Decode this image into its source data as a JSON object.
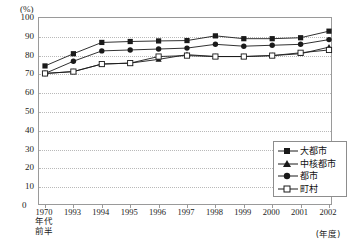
{
  "axis": {
    "y_unit": "(%)",
    "y_ticks": [
      100,
      90,
      80,
      70,
      60,
      50,
      40,
      30,
      20,
      10,
      0
    ],
    "x_unit": "(年度)",
    "zero": "0"
  },
  "legend": {
    "position": "bottom-right",
    "items": [
      {
        "label": "大都市",
        "marker": "filled-square",
        "color": "#1a1a1a"
      },
      {
        "label": "中核都市",
        "marker": "filled-triangle",
        "color": "#1a1a1a"
      },
      {
        "label": "都市",
        "marker": "filled-circle",
        "color": "#1a1a1a"
      },
      {
        "label": "町村",
        "marker": "open-square",
        "color": "#1a1a1a"
      }
    ]
  },
  "chart_data": {
    "type": "line",
    "title": "",
    "subtitle": "",
    "xlabel": "(年度)",
    "ylabel": "(%)",
    "ylim": [
      0,
      100
    ],
    "ytick_step": 10,
    "grid": true,
    "legend_position": "lower right",
    "categories": [
      "1970年代前半",
      "1993",
      "1994",
      "1995",
      "1996",
      "1997",
      "1998",
      "1999",
      "2000",
      "2001",
      "2002"
    ],
    "category_lines": [
      [
        "1970",
        "年代",
        "前半"
      ],
      [
        "1993"
      ],
      [
        "1994"
      ],
      [
        "1995"
      ],
      [
        "1996"
      ],
      [
        "1997"
      ],
      [
        "1998"
      ],
      [
        "1999"
      ],
      [
        "2000"
      ],
      [
        "2001"
      ],
      [
        "2002"
      ]
    ],
    "series": [
      {
        "name": "大都市",
        "marker": "filled-square",
        "values": [
          74.5,
          81.0,
          87.0,
          87.5,
          87.8,
          88.0,
          90.5,
          89.0,
          89.0,
          89.5,
          93.0
        ]
      },
      {
        "name": "中核都市",
        "marker": "filled-triangle",
        "values": [
          70.5,
          71.5,
          75.5,
          76.0,
          78.0,
          80.5,
          79.5,
          79.5,
          80.0,
          81.0,
          84.5
        ]
      },
      {
        "name": "都市",
        "marker": "filled-circle",
        "values": [
          70.5,
          77.0,
          82.5,
          83.0,
          83.5,
          84.0,
          86.0,
          85.0,
          85.5,
          86.0,
          88.5
        ]
      },
      {
        "name": "町村",
        "marker": "open-square",
        "values": [
          70.5,
          71.5,
          75.5,
          76.0,
          79.5,
          80.0,
          79.5,
          79.5,
          80.0,
          81.5,
          83.0
        ]
      }
    ]
  }
}
